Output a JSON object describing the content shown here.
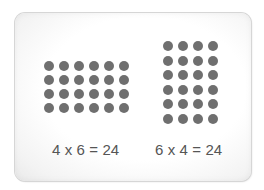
{
  "card": {
    "background": "#ffffff",
    "border_color": "#d6d6d6"
  },
  "arrays": [
    {
      "rows": 4,
      "columns": 6,
      "dot_color": "#6f6f6f",
      "equation": "4 x 6 = 24"
    },
    {
      "rows": 6,
      "columns": 4,
      "dot_color": "#6f6f6f",
      "equation": "6 x 4 = 24"
    }
  ],
  "text_color": "#555555"
}
